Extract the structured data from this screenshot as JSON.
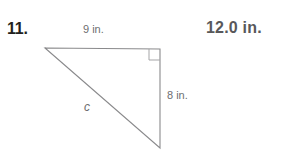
{
  "problem": {
    "number": "11.",
    "answer": "12.0 in."
  },
  "figure": {
    "name": "right-triangle",
    "stroke_color": "#8a8a8c",
    "labels": {
      "top_leg": "9 in.",
      "right_leg": "8 in.",
      "hypotenuse": "c"
    },
    "right_angle_marker": "right-angle-square",
    "vertices": {
      "left": [
        45,
        48
      ],
      "top_right": [
        160,
        49
      ],
      "bottom_right": [
        160,
        148
      ]
    }
  }
}
